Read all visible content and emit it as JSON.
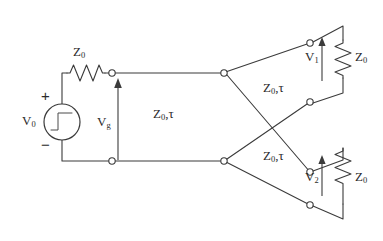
{
  "diagram": {
    "colors": {
      "wire": "#3b3b3b",
      "text": "#2b2b2b",
      "background": "#ffffff"
    },
    "source": {
      "label": "V",
      "subscript": "0",
      "plus_sign": "+",
      "minus_sign": "−",
      "symbol_name": "step-function-source"
    },
    "series_resistor": {
      "label": "Z",
      "subscript": "0"
    },
    "gen_voltage": {
      "label": "V",
      "subscript": "g"
    },
    "main_line": {
      "impedance": "Z",
      "impedance_sub": "0",
      "separator": ",",
      "delay": "τ"
    },
    "branch_upper": {
      "impedance": "Z",
      "impedance_sub": "0",
      "separator": ",",
      "delay": "τ"
    },
    "branch_lower": {
      "impedance": "Z",
      "impedance_sub": "0",
      "separator": ",",
      "delay": "τ"
    },
    "load_upper": {
      "voltage_label": "V",
      "voltage_sub": "1",
      "impedance": "Z",
      "impedance_sub": "0"
    },
    "load_lower": {
      "voltage_label": "V",
      "voltage_sub": "2",
      "impedance": "Z",
      "impedance_sub": "0"
    }
  }
}
